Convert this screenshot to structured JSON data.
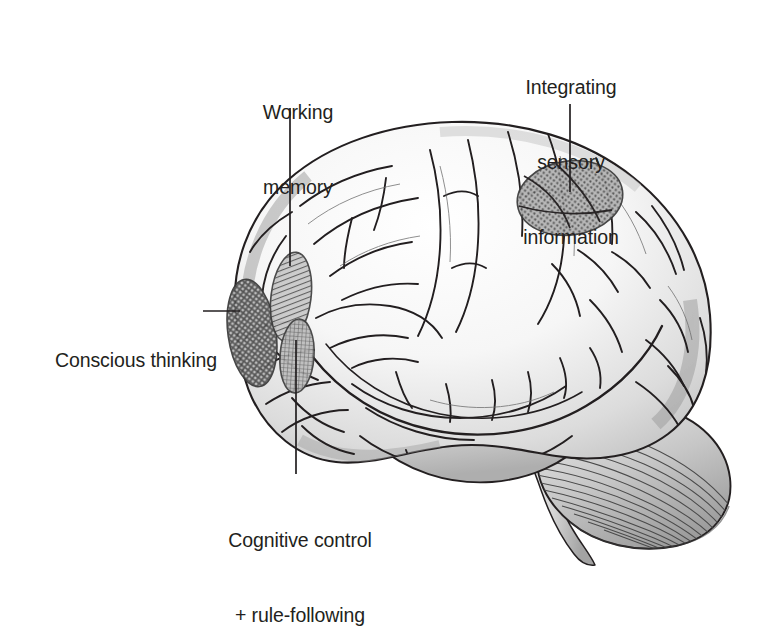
{
  "figure": {
    "kind": "labelled-brain-diagram",
    "background_color": "#ffffff",
    "ink_color": "#231f20",
    "shading_color": "#8c8c8c",
    "region_fill_color": "#7a7a7a"
  },
  "labels": {
    "working_memory": {
      "line1": "Working",
      "line2": "memory",
      "leader": "vertical"
    },
    "integrating_sensory": {
      "line1": "Integrating",
      "line2": "sensory",
      "line3": "information",
      "leader": "vertical"
    },
    "conscious_thinking": {
      "line1": "Conscious thinking",
      "leader": "horizontal"
    },
    "cognitive_control": {
      "line1": "Cognitive control",
      "line2": "+ rule-following",
      "leader": "vertical"
    }
  },
  "regions": [
    {
      "name": "conscious-thinking-region",
      "pattern": "cross-hatch",
      "shape": "vertical ellipse",
      "location": "frontal pole"
    },
    {
      "name": "working-memory-region",
      "pattern": "diagonal-hatch",
      "shape": "vertical ellipse",
      "location": "dorsolateral prefrontal cortex"
    },
    {
      "name": "cognitive-control-region",
      "pattern": "fine-grid",
      "shape": "vertical ellipse",
      "location": "inferior frontal gyrus"
    },
    {
      "name": "integrating-sensory-region",
      "pattern": "dot-grid",
      "shape": "large ellipse",
      "location": "parietal cortex"
    }
  ]
}
